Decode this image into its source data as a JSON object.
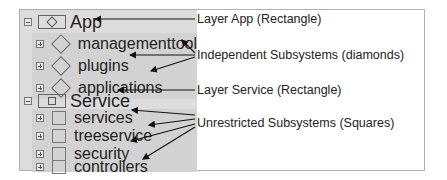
{
  "tree": {
    "layers": [
      {
        "label": "App",
        "shape": "rectangle-with-diamond",
        "expanded": true,
        "children": [
          {
            "label": "managementtool",
            "shape": "diamond"
          },
          {
            "label": "plugins",
            "shape": "diamond"
          },
          {
            "label": "applications",
            "shape": "diamond"
          }
        ]
      },
      {
        "label": "Service",
        "shape": "rectangle-with-square",
        "expanded": true,
        "children": [
          {
            "label": "services",
            "shape": "square"
          },
          {
            "label": "treeservice",
            "shape": "square"
          },
          {
            "label": "security",
            "shape": "square"
          },
          {
            "label": "controllers",
            "shape": "square"
          }
        ]
      }
    ]
  },
  "annotations": {
    "layer_app": "Layer App (Rectangle)",
    "independent": "Independent Subsystems (diamonds)",
    "layer_service": "Layer Service (Rectangle)",
    "unrestricted": "Unrestricted Subsystems (Squares)"
  },
  "colors": {
    "tree_bg": "#dcdcdc",
    "child_bg": "#d2d2d2",
    "arrow": "#111111",
    "border": "#b0b0b0"
  }
}
